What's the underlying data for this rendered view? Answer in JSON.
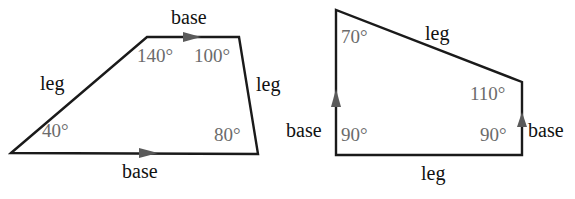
{
  "figures": [
    {
      "name": "trapezoid-left",
      "vertices": [
        [
          11,
          153
        ],
        [
          147,
          37
        ],
        [
          239,
          37
        ],
        [
          258,
          154
        ]
      ],
      "labels": {
        "top_base": "base",
        "bottom_base": "base",
        "left_leg": "leg",
        "right_leg": "leg"
      },
      "angles": {
        "bottom_left": "40°",
        "top_left": "140°",
        "top_right": "100°",
        "bottom_right": "80°"
      }
    },
    {
      "name": "trapezoid-right",
      "vertices": [
        [
          336,
          10
        ],
        [
          336,
          155
        ],
        [
          522,
          155
        ],
        [
          522,
          82
        ]
      ],
      "labels": {
        "top_leg": "leg",
        "bottom_leg": "leg",
        "left_base": "base",
        "right_base": "base"
      },
      "angles": {
        "top_left": "70°",
        "top_right": "110°",
        "bottom_left": "90°",
        "bottom_right": "90°"
      }
    }
  ],
  "colors": {
    "edge": "#1a1a1a",
    "angle_text": "#6b6b6b",
    "label_text": "#111111",
    "arrow": "#5a5a5a"
  }
}
